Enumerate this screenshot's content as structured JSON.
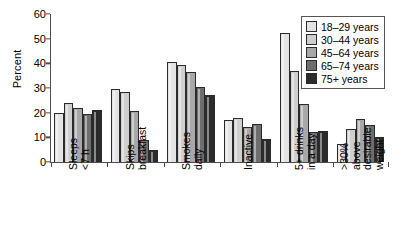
{
  "chart_data": {
    "type": "bar",
    "title": "",
    "xlabel": "",
    "ylabel": "Percent",
    "ylim": [
      0,
      60
    ],
    "yticks": [
      0,
      10,
      20,
      30,
      40,
      50,
      60
    ],
    "grid": false,
    "legend_position": "top-right",
    "categories": [
      "Sleeps\n<7 h",
      "Skips\nbreakfast",
      "Smokes\ndaily",
      "Inactive",
      "5+ drinks\nin a day",
      ">30%\nabove\ndesirable\nweight"
    ],
    "category_lines": [
      [
        "Sleeps",
        "<7 h"
      ],
      [
        "Skips",
        "breakfast"
      ],
      [
        "Smokes",
        "daily"
      ],
      [
        "Inactive"
      ],
      [
        "5+ drinks",
        "in a day"
      ],
      [
        ">30%",
        "above",
        "desirable",
        "weight"
      ]
    ],
    "series": [
      {
        "name": "18–29 years",
        "color": "#e3e3e3",
        "values": [
          20.0,
          29.5,
          40.5,
          17.0,
          52.5,
          7.5
        ]
      },
      {
        "name": "30–44 years",
        "color": "#cfcfcf",
        "values": [
          24.0,
          28.5,
          39.5,
          18.0,
          37.0,
          13.5
        ]
      },
      {
        "name": "45–64 years",
        "color": "#a8a8a8",
        "values": [
          22.0,
          20.5,
          36.5,
          14.0,
          23.5,
          17.5
        ]
      },
      {
        "name": "65–74 years",
        "color": "#6e6e6e",
        "values": [
          19.5,
          9.0,
          30.5,
          15.5,
          12.0,
          15.0
        ]
      },
      {
        "name": "75+ years",
        "color": "#2b2b2b",
        "values": [
          21.0,
          5.0,
          27.0,
          9.5,
          12.5,
          10.0
        ]
      }
    ]
  },
  "legend": {
    "items": [
      {
        "label": "18–29 years",
        "color": "#e3e3e3"
      },
      {
        "label": "30–44 years",
        "color": "#cfcfcf"
      },
      {
        "label": "45–64 years",
        "color": "#a8a8a8"
      },
      {
        "label": "65–74 years",
        "color": "#6e6e6e"
      },
      {
        "label": "75+ years",
        "color": "#2b2b2b"
      }
    ]
  },
  "axis": {
    "y_title": "Percent",
    "y_tick_labels": [
      "60",
      "50",
      "40",
      "30",
      "20",
      "10",
      "0"
    ]
  },
  "colors": {
    "axis": "#4d4d4d",
    "bar_outline": "#2b2b2b",
    "background": "#ffffff"
  }
}
